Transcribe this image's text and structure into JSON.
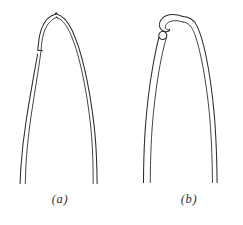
{
  "figure": {
    "background_color": "#ffffff",
    "ink_color": "#2b2b2b",
    "width": 243,
    "height": 225,
    "panels": [
      {
        "id": "a",
        "caption": "(a)",
        "tip_style": "pointed-arched-tip-with-step",
        "prong_count": 2
      },
      {
        "id": "b",
        "caption": "(b)",
        "tip_style": "hooked-curled-tip-with-knob",
        "prong_count": 2
      }
    ]
  }
}
